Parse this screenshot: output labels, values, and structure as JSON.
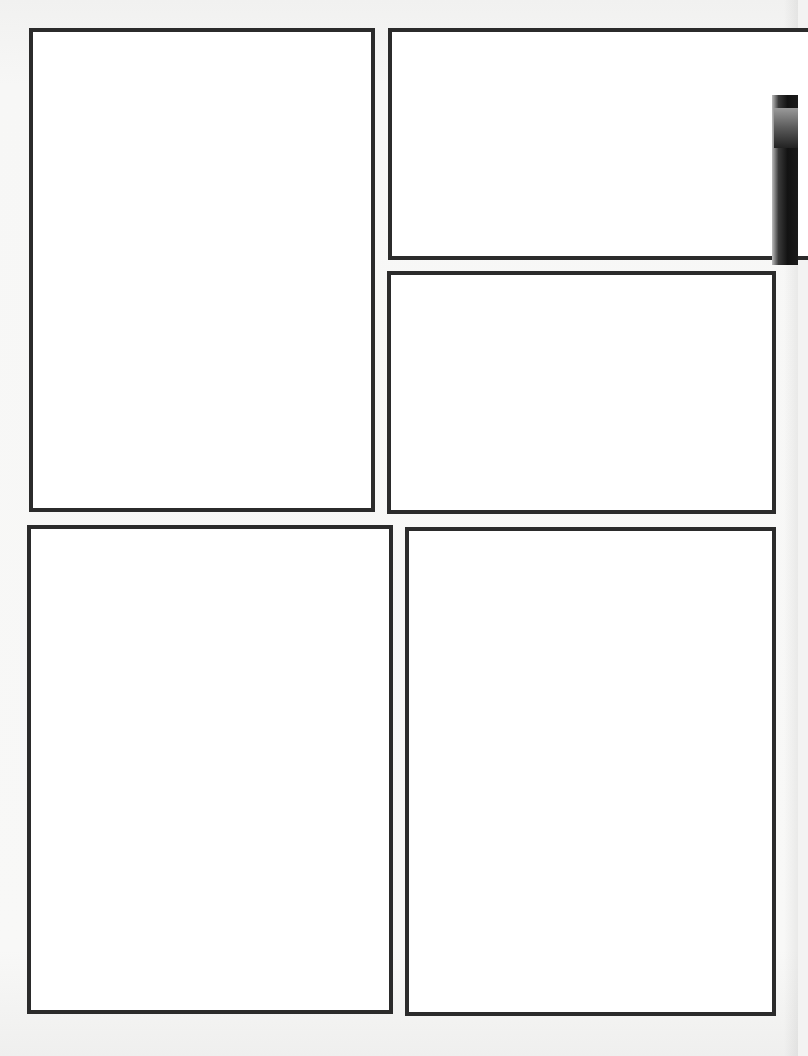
{
  "page": {
    "type": "blank comic panel template",
    "background_color": "#f3f3f2",
    "border_color": "#2b2b2b",
    "panel_count": 5
  },
  "panels": [
    {
      "id": "panel-1",
      "position": "top-left",
      "x": 29,
      "y": 28,
      "w": 346,
      "h": 484,
      "content": ""
    },
    {
      "id": "panel-2",
      "position": "top-right",
      "x": 388,
      "y": 28,
      "w": 420,
      "h": 232,
      "content": ""
    },
    {
      "id": "panel-3",
      "position": "middle-right",
      "x": 387,
      "y": 271,
      "w": 389,
      "h": 243,
      "content": ""
    },
    {
      "id": "panel-4",
      "position": "bottom-left",
      "x": 27,
      "y": 525,
      "w": 366,
      "h": 489,
      "content": ""
    },
    {
      "id": "panel-5",
      "position": "bottom-right",
      "x": 405,
      "y": 527,
      "w": 371,
      "h": 489,
      "content": ""
    }
  ]
}
